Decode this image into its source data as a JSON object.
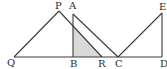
{
  "figure": {
    "type": "geometry-diagram",
    "colors": {
      "line": "#3a3a3a",
      "shade": "#d9d9d9",
      "background": "#ffffff"
    },
    "points": {
      "Q": {
        "label": "Q",
        "x": 14,
        "y": 57
      },
      "P": {
        "label": "P",
        "x": 59,
        "y": 11
      },
      "A": {
        "label": "A",
        "x": 73,
        "y": 14
      },
      "B": {
        "label": "B",
        "x": 73,
        "y": 57
      },
      "R": {
        "label": "R",
        "x": 102,
        "y": 57
      },
      "C": {
        "label": "C",
        "x": 118,
        "y": 57
      },
      "D": {
        "label": "D",
        "x": 162,
        "y": 57
      },
      "E": {
        "label": "E",
        "x": 162,
        "y": 13
      }
    },
    "segments": [
      "QP",
      "PR",
      "AB",
      "AC",
      "QD",
      "CE",
      "ED"
    ],
    "shaded_region": [
      "B",
      "AB∩PR",
      "R"
    ]
  }
}
